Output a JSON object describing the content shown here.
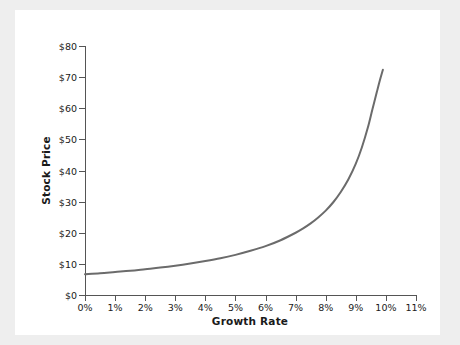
{
  "chart_data": {
    "type": "line",
    "title": "",
    "xlabel": "Growth Rate",
    "ylabel": "Stock Price",
    "xlim": [
      0,
      11
    ],
    "ylim": [
      0,
      80
    ],
    "grid": false,
    "legend": null,
    "x_tick_labels": [
      "0%",
      "1%",
      "2%",
      "3%",
      "4%",
      "5%",
      "6%",
      "7%",
      "8%",
      "9%",
      "10%",
      "11%"
    ],
    "x_tick_values": [
      0,
      1,
      2,
      3,
      4,
      5,
      6,
      7,
      8,
      9,
      10,
      11
    ],
    "y_tick_labels": [
      "$0",
      "$10",
      "$20",
      "$30",
      "$40",
      "$50",
      "$60",
      "$70",
      "$80"
    ],
    "y_tick_values": [
      0,
      10,
      20,
      30,
      40,
      50,
      60,
      70,
      80
    ],
    "line_color": "#6b6b6b",
    "line_width": 2,
    "series": [
      {
        "name": "Stock Price",
        "x": [
          0,
          0.5,
          1,
          1.5,
          2,
          2.5,
          3,
          3.5,
          4,
          4.5,
          5,
          5.5,
          6,
          6.5,
          7,
          7.25,
          7.5,
          7.75,
          8,
          8.25,
          8.5,
          8.75,
          9,
          9.2,
          9.4,
          9.55,
          9.7,
          9.8,
          9.9
        ],
        "y": [
          6.7,
          7.0,
          7.4,
          7.8,
          8.3,
          8.8,
          9.4,
          10.1,
          10.9,
          11.8,
          12.9,
          14.2,
          15.7,
          17.6,
          20.0,
          21.4,
          23.0,
          24.9,
          27.1,
          29.8,
          33.1,
          37.1,
          42.2,
          47.4,
          53.8,
          59.6,
          65.3,
          69.0,
          72.4
        ]
      }
    ]
  },
  "figure": {
    "background": "#ffffff",
    "page_background": "#eeeeee",
    "axis_color": "#555555",
    "text_color": "#1a1a1a"
  }
}
